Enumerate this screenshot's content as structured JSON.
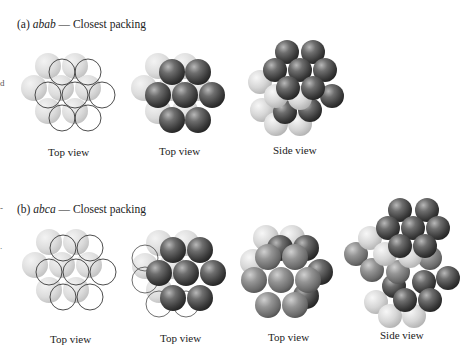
{
  "panels": [
    {
      "id": "a",
      "prefix": "(a) ",
      "sequence": "abab",
      "suffix": " — Closest packing",
      "views": [
        {
          "label": "Top view"
        },
        {
          "label": "Top view"
        },
        {
          "label": "Side view"
        }
      ]
    },
    {
      "id": "b",
      "prefix": "(b) ",
      "sequence": "abca",
      "suffix": " — Closest packing",
      "views": [
        {
          "label": "Top view"
        },
        {
          "label": "Top view"
        },
        {
          "label": "Top view"
        },
        {
          "label": "Side view"
        }
      ]
    }
  ],
  "edge_marks": [
    "d",
    "-",
    "."
  ],
  "colors": {
    "layer_a_light": "#d9d9d9",
    "layer_b_dark": "#4a4a4a",
    "layer_c_medium": "#7d7d7d",
    "outline": "#333333"
  }
}
